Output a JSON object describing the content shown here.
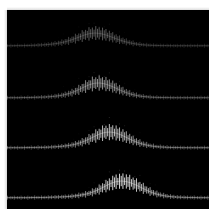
{
  "figure": {
    "title": "",
    "background_color": "#ffffff",
    "plot_background_color": "#000000",
    "trace_color": "#ffffff",
    "plot_left": 7,
    "plot_top": 10,
    "plot_width": 202,
    "plot_height": 199
  },
  "chart_data": {
    "type": "line",
    "title": "",
    "subtitle": "",
    "xlabel": "",
    "ylabel": "",
    "grid": false,
    "legend": "none",
    "axis_visible": false,
    "tick_labels_visible": false,
    "style": "stacked-ridgeline-stipple",
    "xlim": [
      0,
      1
    ],
    "ylim": [
      0,
      1
    ],
    "tick_count_per_trace": 120,
    "baseline_tick_height": 3.2,
    "series": [
      {
        "name": "trace-1",
        "baseline_y": 36,
        "peak_center_x": 0.27,
        "peak_width": 0.23,
        "peak_amplitude": 13,
        "tick_amplitude_peak": 9,
        "brightness": 0.42,
        "values": [
          0.02,
          0.02,
          0.03,
          0.03,
          0.04,
          0.05,
          0.07,
          0.09,
          0.12,
          0.16,
          0.22,
          0.3,
          0.41,
          0.55,
          0.7,
          0.85,
          0.96,
          1.0,
          0.96,
          0.86,
          0.72,
          0.57,
          0.43,
          0.31,
          0.22,
          0.15,
          0.1,
          0.07,
          0.05,
          0.04,
          0.03,
          0.03,
          0.02,
          0.02,
          0.02,
          0.02,
          0.02,
          0.02,
          0.02,
          0.02
        ]
      },
      {
        "name": "trace-2",
        "baseline_y": 88,
        "peak_center_x": 0.385,
        "peak_width": 0.22,
        "peak_amplitude": 15,
        "tick_amplitude_peak": 10,
        "brightness": 0.68,
        "values": [
          0.02,
          0.02,
          0.02,
          0.03,
          0.03,
          0.04,
          0.05,
          0.06,
          0.08,
          0.11,
          0.15,
          0.21,
          0.3,
          0.42,
          0.58,
          0.75,
          0.9,
          0.99,
          1.0,
          0.93,
          0.81,
          0.66,
          0.5,
          0.36,
          0.25,
          0.17,
          0.11,
          0.08,
          0.05,
          0.04,
          0.03,
          0.03,
          0.02,
          0.02,
          0.02,
          0.02,
          0.02,
          0.02,
          0.02,
          0.02
        ]
      },
      {
        "name": "trace-3",
        "baseline_y": 138,
        "peak_center_x": 0.52,
        "peak_width": 0.2,
        "peak_amplitude": 16,
        "tick_amplitude_peak": 11,
        "brightness": 0.88,
        "values": [
          0.02,
          0.02,
          0.02,
          0.02,
          0.03,
          0.03,
          0.04,
          0.04,
          0.05,
          0.07,
          0.09,
          0.12,
          0.16,
          0.22,
          0.31,
          0.43,
          0.58,
          0.74,
          0.89,
          0.98,
          1.0,
          0.94,
          0.82,
          0.67,
          0.51,
          0.37,
          0.26,
          0.18,
          0.12,
          0.08,
          0.06,
          0.04,
          0.03,
          0.03,
          0.02,
          0.02,
          0.02,
          0.02,
          0.02,
          0.02
        ]
      },
      {
        "name": "trace-4",
        "baseline_y": 188,
        "peak_center_x": 0.67,
        "peak_width": 0.19,
        "peak_amplitude": 17,
        "tick_amplitude_peak": 11,
        "brightness": 1.0,
        "values": [
          0.02,
          0.02,
          0.02,
          0.02,
          0.02,
          0.03,
          0.03,
          0.03,
          0.04,
          0.05,
          0.06,
          0.07,
          0.09,
          0.12,
          0.16,
          0.21,
          0.29,
          0.4,
          0.54,
          0.7,
          0.85,
          0.96,
          1.0,
          0.97,
          0.88,
          0.75,
          0.6,
          0.45,
          0.32,
          0.22,
          0.15,
          0.1,
          0.07,
          0.05,
          0.04,
          0.03,
          0.03,
          0.02,
          0.02,
          0.02
        ]
      }
    ]
  }
}
